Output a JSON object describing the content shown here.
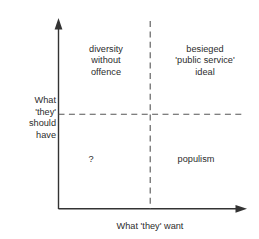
{
  "chart_data": {
    "type": "scatter",
    "title": "",
    "subtitle": "",
    "xlabel": "What 'they' want",
    "ylabel": "What 'they' should have",
    "grid": false,
    "legend": null,
    "axis_style": "arrow",
    "divider_style": "dashed",
    "quadrants": [
      {
        "position": "top-left",
        "label": "diversity\nwithout\noffence",
        "x_level": "low",
        "y_level": "high"
      },
      {
        "position": "top-right",
        "label": "besieged\n'public service'\nideal",
        "x_level": "high",
        "y_level": "high"
      },
      {
        "position": "bottom-left",
        "label": "?",
        "x_level": "low",
        "y_level": "low"
      },
      {
        "position": "bottom-right",
        "label": "populism",
        "x_level": "high",
        "y_level": "low"
      }
    ]
  },
  "diagram": {
    "x_axis": {
      "label": "What 'they' want",
      "arrow": true
    },
    "y_axis": {
      "label": "What 'they' should have",
      "arrow": true
    },
    "quadrant_top_left": "diversity\nwithout\noffence",
    "quadrant_top_right": "besieged\n'public service'\nideal",
    "quadrant_bottom_left": "?",
    "quadrant_bottom_right": "populism"
  },
  "colors": {
    "background": "#ffffff",
    "ink": "#2b2b2b",
    "axis": "#333333",
    "dashed": "#555555"
  }
}
